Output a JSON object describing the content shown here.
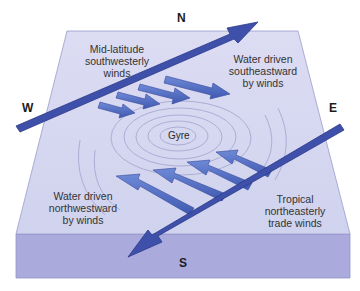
{
  "diagram": {
    "title": "",
    "compass": {
      "north": "N",
      "south": "S",
      "east": "E",
      "west": "W"
    },
    "center_label": "Gyre",
    "labels": {
      "westerlies": "Mid-latitude\nsouthwesterly\nwinds",
      "water_se": "Water driven\nsoutheastward\nby winds",
      "water_nw": "Water driven\nnorthwestward\nby winds",
      "trades": "Tropical\nnortheasterly\ntrade winds"
    },
    "colors": {
      "top_face": "#d4d6ef",
      "front_face": "#a9a9dc",
      "edge": "#8f90c8",
      "wind_arrow": "#3f4fa8",
      "water_arrow": "#5a78c4",
      "ripple": "#a7abd2"
    }
  }
}
